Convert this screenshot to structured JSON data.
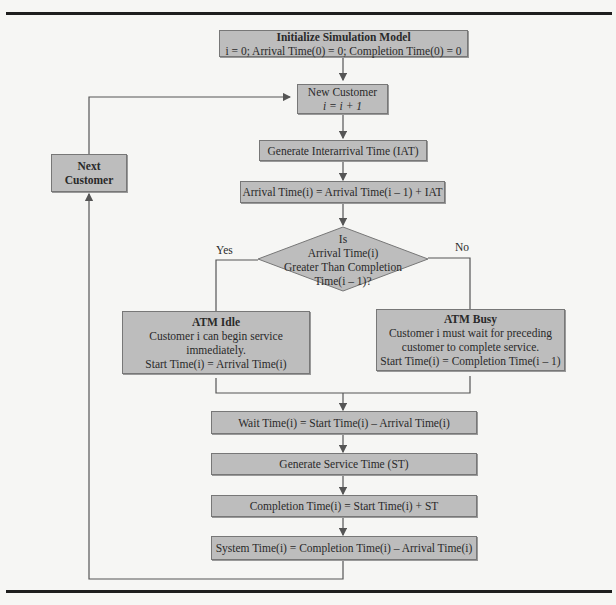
{
  "flowchart": {
    "init": {
      "title": "Initialize Simulation Model",
      "text": "i = 0; Arrival Time(0) = 0; Completion Time(0) = 0"
    },
    "new_customer": {
      "title": "New Customer",
      "text": "i = i + 1"
    },
    "gen_iat": {
      "text": "Generate Interarrival Time (IAT)"
    },
    "arrival": {
      "text": "Arrival Time(i) = Arrival Time(i – 1) + IAT"
    },
    "decision": {
      "line1": "Is",
      "line2": "Arrival Time(i)",
      "line3": "Greater Than Completion",
      "line4": "Time(i – 1)?"
    },
    "yes_label": "Yes",
    "no_label": "No",
    "atm_idle": {
      "title": "ATM Idle",
      "line1": "Customer i can begin service",
      "line2": "immediately.",
      "line3": "Start Time(i) = Arrival Time(i)"
    },
    "atm_busy": {
      "title": "ATM Busy",
      "line1": "Customer i must wait for preceding",
      "line2": "customer to complete service.",
      "line3": "Start Time(i) = Completion Time(i – 1)"
    },
    "wait": {
      "text": "Wait Time(i) = Start Time(i) – Arrival Time(i)"
    },
    "gen_st": {
      "text": "Generate Service Time (ST)"
    },
    "completion": {
      "text": "Completion Time(i) = Start Time(i) + ST"
    },
    "system": {
      "text": "System Time(i) = Completion Time(i) – Arrival Time(i)"
    },
    "next_customer": {
      "line1": "Next",
      "line2": "Customer"
    }
  },
  "colors": {
    "box_fill": "#bdbdbd",
    "box_border": "#777777",
    "line": "#555555",
    "background": "#f6f6f4"
  }
}
